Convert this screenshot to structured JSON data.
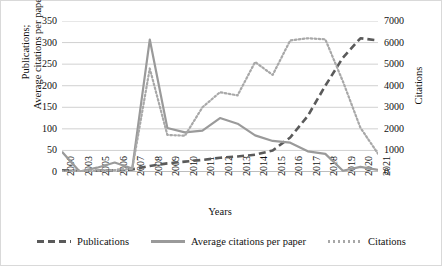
{
  "chart_data": {
    "type": "line",
    "title": "",
    "xlabel": "Years",
    "ylabel": "Publications; Average citations per paper",
    "ylabel_line1": "Publications;",
    "ylabel_line2": "Average citations per paper",
    "y2label": "Citations",
    "ylim": [
      0,
      350
    ],
    "y2lim": [
      0,
      7000
    ],
    "yticks": [
      0,
      50,
      100,
      150,
      200,
      250,
      300,
      350
    ],
    "y2ticks": [
      0,
      1000,
      2000,
      3000,
      4000,
      5000,
      6000,
      7000
    ],
    "grid": true,
    "legend_position": "bottom",
    "categories": [
      "2000",
      "2003",
      "2005",
      "2006",
      "2007",
      "2008",
      "2009",
      "2010",
      "2011",
      "2012",
      "2013",
      "2014",
      "2015",
      "2016",
      "2017",
      "2018",
      "2019",
      "2020",
      "2021"
    ],
    "series": [
      {
        "name": "Publications",
        "axis": "left",
        "style": "dashed",
        "color": "#5a5a5a",
        "values": [
          4,
          2,
          3,
          4,
          6,
          14,
          20,
          24,
          28,
          33,
          36,
          40,
          50,
          80,
          130,
          200,
          265,
          310,
          305
        ]
      },
      {
        "name": "Average citations per paper",
        "axis": "left",
        "style": "solid",
        "color": "#9a9a9a",
        "values": [
          47,
          1,
          10,
          22,
          8,
          307,
          102,
          92,
          96,
          125,
          112,
          85,
          72,
          68,
          48,
          42,
          3,
          12,
          5
        ]
      },
      {
        "name": "Citations",
        "axis": "right",
        "style": "dotted",
        "color": "#a8a8a8",
        "values": [
          30,
          40,
          60,
          90,
          140,
          4800,
          1720,
          1680,
          3000,
          3700,
          3550,
          5100,
          4500,
          6100,
          6200,
          6150,
          4200,
          2050,
          850
        ]
      }
    ]
  },
  "legend": {
    "items": [
      {
        "label": "Publications",
        "key": "publications"
      },
      {
        "label": "Average citations per paper",
        "key": "average-citations-per-paper"
      },
      {
        "label": "Citations",
        "key": "citations"
      }
    ]
  }
}
